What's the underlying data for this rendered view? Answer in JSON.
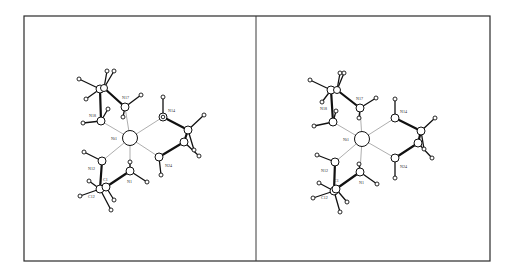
{
  "figure": {
    "type": "stereo-pair molecular structure (ORTEP-style)",
    "panels": [
      {
        "name": "left-view",
        "offset_x": 0
      },
      {
        "name": "right-view",
        "offset_x": 233
      }
    ],
    "metal_center": {
      "label": "Ni1"
    },
    "atom_labels": {
      "ni1": "Ni1",
      "n17": "N17",
      "n18": "N18",
      "n14": "N14",
      "n24": "N24",
      "n12": "N12",
      "n1": "N1",
      "c1": "C1",
      "c12": "C12"
    },
    "colors": {
      "background": "#ffffff",
      "frame": "#2a2a2a",
      "bond": "#111111",
      "coordination_bond": "#777777"
    }
  }
}
